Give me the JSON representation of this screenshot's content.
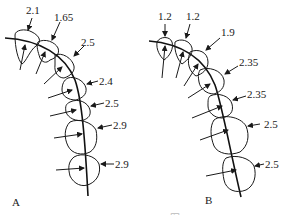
{
  "panels": [
    {
      "id": "A",
      "label": "A",
      "values": [
        "2.1",
        "1.65",
        "2.5",
        "2.4",
        "2.5",
        "2.9",
        "2.9"
      ]
    },
    {
      "id": "B",
      "label": "B",
      "values": [
        "1.2",
        "1.2",
        "1.9",
        "2.35",
        "2.35",
        "2.5",
        "2.5"
      ]
    }
  ],
  "caption": "……图"
}
